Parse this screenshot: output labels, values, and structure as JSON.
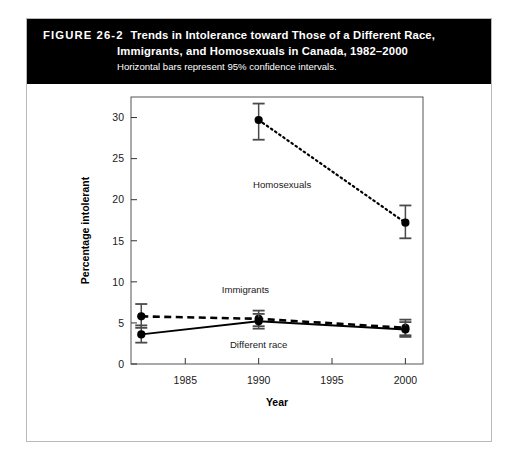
{
  "figure": {
    "number": "FIGURE 26-2",
    "title_line_1": "Trends in Intolerance toward Those of a Different Race,",
    "title_line_2": "Immigrants, and Homosexuals in Canada, 1982–2000",
    "subtitle": "Horizontal bars represent 95% confidence intervals.",
    "banner_color": "#000000",
    "banner_text_color": "#ffffff",
    "border_color": "#b9b9b9"
  },
  "chart_data": {
    "type": "line",
    "title": "Trends in Intolerance toward Those of a Different Race, Immigrants, and Homosexuals in Canada, 1982–2000",
    "subtitle": "Horizontal bars represent 95% confidence intervals.",
    "xlabel": "Year",
    "ylabel": "Percentage intolerant",
    "xlim": [
      1981.3,
      2001.2
    ],
    "ylim": [
      0,
      32.5
    ],
    "xticks": [
      1985,
      1990,
      1995,
      2000
    ],
    "xtick_labels": [
      "1985",
      "1990",
      "1995",
      "2000"
    ],
    "yticks": [
      0,
      5,
      10,
      15,
      20,
      25,
      30
    ],
    "ytick_labels": [
      "0",
      "5",
      "10",
      "15",
      "20",
      "25",
      "30"
    ],
    "grid": false,
    "legend": "inline-annotations",
    "error_bars": "95% confidence intervals",
    "series": [
      {
        "name": "Homosexuals",
        "line_style": "dotted",
        "marker": "filled-circle",
        "x": [
          1990,
          2000
        ],
        "values": [
          29.7,
          17.2
        ],
        "ci_low": [
          27.3,
          15.3
        ],
        "ci_high": [
          31.7,
          19.3
        ],
        "label_x": 1991.6,
        "label_y": 21.4
      },
      {
        "name": "Immigrants",
        "line_style": "dashed",
        "marker": "filled-circle",
        "x": [
          1982,
          1990,
          2000
        ],
        "values": [
          5.8,
          5.5,
          4.4
        ],
        "ci_low": [
          4.4,
          4.6,
          3.5
        ],
        "ci_high": [
          7.3,
          6.5,
          5.4
        ],
        "label_x": 1989.1,
        "label_y": 8.6
      },
      {
        "name": "Different race",
        "line_style": "solid",
        "marker": "filled-circle",
        "x": [
          1982,
          1990,
          2000
        ],
        "values": [
          3.6,
          5.2,
          4.2
        ],
        "ci_low": [
          2.6,
          4.3,
          3.3
        ],
        "ci_high": [
          4.7,
          6.1,
          5.1
        ],
        "label_x": 1990.0,
        "label_y": 1.9
      }
    ]
  }
}
